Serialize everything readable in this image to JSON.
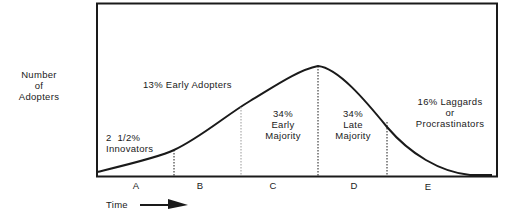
{
  "diagram": {
    "type": "diffusion-of-innovation-bell-curve",
    "y_axis_label": [
      "Number",
      "of",
      "Adopters"
    ],
    "x_axis_label": "Time",
    "segments": [
      {
        "letter": "A",
        "percent": "2  1/2%",
        "name": "Innovators"
      },
      {
        "letter": "B",
        "percent": "13%",
        "name": "Early Adopters"
      },
      {
        "letter": "C",
        "percent": "34%",
        "name_lines": [
          "Early",
          "Majority"
        ]
      },
      {
        "letter": "D",
        "percent": "34%",
        "name_lines": [
          "Late",
          "Majority"
        ]
      },
      {
        "letter": "E",
        "percent": "16%",
        "name": "Laggards",
        "alt": "or",
        "alt_name": "Procrastinators"
      }
    ]
  },
  "labels": {
    "ylabel_1": "Number",
    "ylabel_2": "of",
    "ylabel_3": "Adopters",
    "innovators_pct": "2  1/2%",
    "innovators": "Innovators",
    "early_adopters": "13% Early Adopters",
    "early_majority_pct": "34%",
    "early_majority_1": "Early",
    "early_majority_2": "Majority",
    "late_majority_pct": "34%",
    "late_majority_1": "Late",
    "late_majority_2": "Majority",
    "laggards": "16% Laggards",
    "laggards_or": "or",
    "laggards_alt": "Procrastinators",
    "seg_a": "A",
    "seg_b": "B",
    "seg_c": "C",
    "seg_d": "D",
    "seg_e": "E",
    "time": "Time"
  },
  "colors": {
    "line": "#1a1a1a",
    "background": "#ffffff"
  }
}
